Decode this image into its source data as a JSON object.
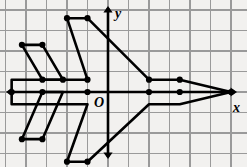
{
  "figure": {
    "background_color": "#f2f1ef",
    "grid_color": "#9a9a9a",
    "grid_minor_color": "#c9c8c6",
    "axis_color": "#000000",
    "stroke_color": "#000000",
    "vertex_color": "#000000"
  },
  "axes": {
    "origin_label": "O",
    "x_label": "x",
    "y_label": "y",
    "origin_px": {
      "x": 108,
      "y": 92
    },
    "cell_px": {
      "w": 20.5,
      "h": 20.5
    },
    "x_range": [
      -5.3,
      6.8
    ],
    "y_range": [
      -3.6,
      4.5
    ],
    "x_axis_arrows": [
      "left",
      "right"
    ],
    "y_axis_arrows": [
      "up",
      "down"
    ],
    "grid": true,
    "tick_labels": []
  },
  "chart_data": {
    "type": "scatter",
    "xlabel": "x",
    "ylabel": "y",
    "xlim": [
      -5.3,
      6.8
    ],
    "ylim": [
      -3.6,
      4.5
    ],
    "grid": true,
    "legend": "none",
    "units_per_cell": 1,
    "shapes": [
      {
        "name": "fuselage-and-fins",
        "closed": true,
        "points": [
          [
            -2,
            3.6
          ],
          [
            -1,
            3.6
          ],
          [
            2,
            0.6
          ],
          [
            3.5,
            0.6
          ],
          [
            6,
            0
          ],
          [
            3.5,
            -0.6
          ],
          [
            2,
            -0.6
          ],
          [
            -1,
            -3.4
          ],
          [
            -2,
            -3.4
          ],
          [
            -1,
            -0.6
          ],
          [
            -4.7,
            -0.6
          ],
          [
            -4.7,
            0.6
          ],
          [
            -1,
            0.6
          ]
        ]
      },
      {
        "name": "left-upper-wing",
        "closed": true,
        "points": [
          [
            -4.2,
            2.3
          ],
          [
            -3.2,
            2.3
          ],
          [
            -2.2,
            0.6
          ],
          [
            -3.2,
            0.6
          ]
        ]
      },
      {
        "name": "left-lower-wing",
        "closed": true,
        "points": [
          [
            -4.2,
            -2.3
          ],
          [
            -3.2,
            -2.3
          ],
          [
            -2.2,
            0
          ],
          [
            -3.2,
            0
          ]
        ]
      }
    ],
    "vertices": [
      [
        -2,
        3.6
      ],
      [
        -1,
        3.6
      ],
      [
        -4.2,
        2.3
      ],
      [
        -3.2,
        2.3
      ],
      [
        -3.2,
        0.6
      ],
      [
        -2.2,
        0.6
      ],
      [
        -1,
        0.6
      ],
      [
        2,
        0.6
      ],
      [
        3.5,
        0.6
      ],
      [
        -4.7,
        0
      ],
      [
        -3.2,
        0
      ],
      [
        -1,
        0
      ],
      [
        2,
        0
      ],
      [
        3.5,
        0
      ],
      [
        6,
        0
      ],
      [
        -4.2,
        -2.3
      ],
      [
        -3.2,
        -2.3
      ],
      [
        -2,
        -3.4
      ],
      [
        -1,
        -3.4
      ]
    ]
  }
}
